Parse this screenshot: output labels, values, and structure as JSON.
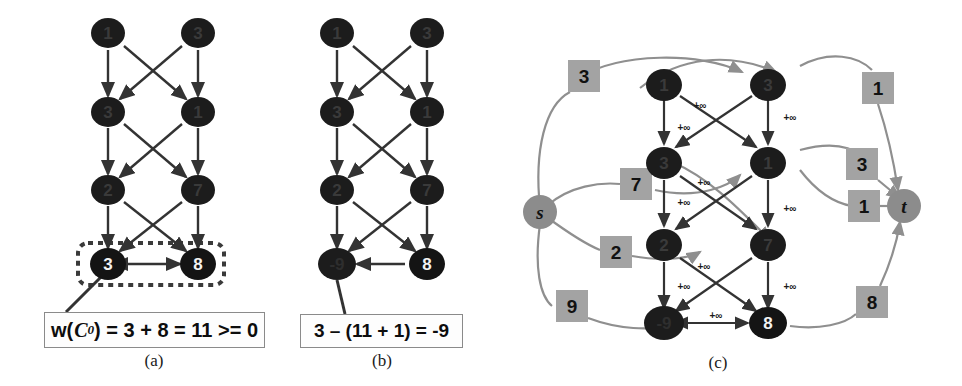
{
  "figure": {
    "panels": [
      {
        "id": "a",
        "letter": "(a)"
      },
      {
        "id": "b",
        "letter": "(b)"
      },
      {
        "id": "c",
        "letter": "(c)"
      }
    ],
    "infinity_label": "+∞",
    "panel_a": {
      "letter": "(a)",
      "nodes": [
        {
          "id": "a1",
          "label": "1",
          "row": 1,
          "col": "left"
        },
        {
          "id": "a2",
          "label": "3",
          "row": 1,
          "col": "right"
        },
        {
          "id": "a3",
          "label": "3",
          "row": 2,
          "col": "left"
        },
        {
          "id": "a4",
          "label": "1",
          "row": 2,
          "col": "right"
        },
        {
          "id": "a5",
          "label": "2",
          "row": 3,
          "col": "left"
        },
        {
          "id": "a6",
          "label": "7",
          "row": 3,
          "col": "right"
        },
        {
          "id": "a7",
          "label": "3",
          "row": 4,
          "col": "left"
        },
        {
          "id": "a8",
          "label": "8",
          "row": 4,
          "col": "right"
        }
      ],
      "highlight_box": "dotted-selection-box",
      "formula": "w(C0) = 3 + 8 = 11 >= 0",
      "formula_parts": {
        "prefix": "w(",
        "var": "C",
        "sub": "0",
        "suffix": ") = 3 + 8 = 11 >= 0"
      }
    },
    "panel_b": {
      "letter": "(b)",
      "nodes": [
        {
          "id": "b1",
          "label": "1",
          "row": 1,
          "col": "left"
        },
        {
          "id": "b2",
          "label": "3",
          "row": 1,
          "col": "right"
        },
        {
          "id": "b3",
          "label": "3",
          "row": 2,
          "col": "left"
        },
        {
          "id": "b4",
          "label": "1",
          "row": 2,
          "col": "right"
        },
        {
          "id": "b5",
          "label": "2",
          "row": 3,
          "col": "left"
        },
        {
          "id": "b6",
          "label": "7",
          "row": 3,
          "col": "right"
        },
        {
          "id": "b7",
          "label": "-9",
          "row": 4,
          "col": "left"
        },
        {
          "id": "b8",
          "label": "8",
          "row": 4,
          "col": "right"
        }
      ],
      "formula": "3 – (11 + 1) = -9"
    },
    "panel_c": {
      "letter": "(c)",
      "source_label": "s",
      "sink_label": "t",
      "nodes": [
        {
          "id": "c1",
          "label": "1",
          "row": 1,
          "col": "left"
        },
        {
          "id": "c2",
          "label": "3",
          "row": 1,
          "col": "right"
        },
        {
          "id": "c3",
          "label": "3",
          "row": 2,
          "col": "left"
        },
        {
          "id": "c4",
          "label": "1",
          "row": 2,
          "col": "right"
        },
        {
          "id": "c5",
          "label": "2",
          "row": 3,
          "col": "left"
        },
        {
          "id": "c6",
          "label": "7",
          "row": 3,
          "col": "right"
        },
        {
          "id": "c7",
          "label": "-9",
          "row": 4,
          "col": "left"
        },
        {
          "id": "c8",
          "label": "8",
          "row": 4,
          "col": "right"
        }
      ],
      "source_capacities": [
        {
          "id": "cap-s-1",
          "value": "3"
        },
        {
          "id": "cap-s-2",
          "value": "7"
        },
        {
          "id": "cap-s-3",
          "value": "2"
        },
        {
          "id": "cap-s-4",
          "value": "9"
        }
      ],
      "sink_capacities": [
        {
          "id": "cap-t-1",
          "value": "1"
        },
        {
          "id": "cap-t-2",
          "value": "3"
        },
        {
          "id": "cap-t-3",
          "value": "1"
        },
        {
          "id": "cap-t-4",
          "value": "8"
        }
      ],
      "internal_edge_labels": [
        "+∞",
        "+∞",
        "+∞",
        "+∞",
        "+∞",
        "+∞",
        "+∞",
        "+∞",
        "+∞",
        "+∞"
      ]
    }
  },
  "colors": {
    "node_fill": "#1c1c1c",
    "source_sink_fill": "#8c8c8c",
    "capacity_box_fill": "#a3a3a3",
    "edge_dark": "#333333",
    "edge_gray": "#8f8f8f",
    "background": "#ffffff"
  }
}
